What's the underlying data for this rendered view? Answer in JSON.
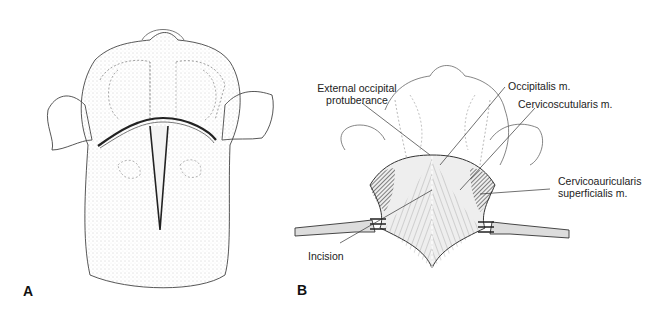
{
  "figure": {
    "panels": [
      {
        "id": "A",
        "letter": "A",
        "description": "Dorsal view of dog head and neck showing T-shaped skin incision"
      },
      {
        "id": "B",
        "letter": "B",
        "description": "Skin retracted exposing cervical musculature"
      }
    ],
    "labels": {
      "ext_occ_line1": "External occipital",
      "ext_occ_line2": "protuberance",
      "occipitalis": "Occipitalis m.",
      "cervicoscutularis": "Cervicoscutularis m.",
      "cervicoauricularis_line1": "Cervicoauricularis",
      "cervicoauricularis_line2": "superficialis m.",
      "incision": "Incision"
    },
    "colors": {
      "line": "#333333",
      "stipple": "#888888",
      "muscle": "#555555"
    }
  }
}
